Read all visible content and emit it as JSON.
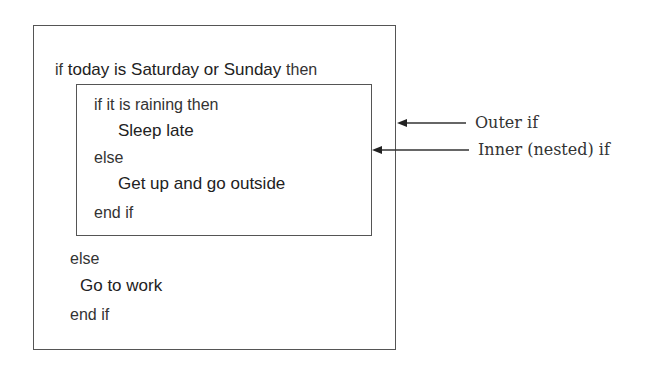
{
  "diagram": {
    "outer_if": {
      "condition_keyword": "if",
      "condition": "today is Saturday or Sunday",
      "then_keyword": "then",
      "inner_if": {
        "line1": "if it is raining then",
        "then_body": "Sleep late",
        "else_keyword": "else",
        "else_body": "Get up and go outside",
        "end": "end if"
      },
      "else_keyword": "else",
      "else_body": "Go to work",
      "end": "end if"
    },
    "annotations": {
      "outer_label": "Outer if",
      "inner_label": "Inner (nested) if"
    },
    "colors": {
      "stroke": "#555555",
      "text": "#222222"
    }
  }
}
